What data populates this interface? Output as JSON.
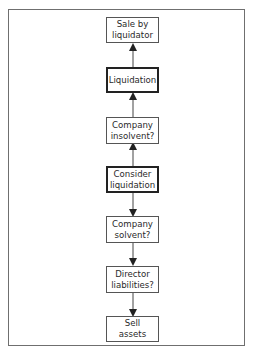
{
  "diagram": {
    "type": "flowchart",
    "orientation": "vertical",
    "colors": {
      "frame": "#6f6f6f",
      "node_border": "#555555",
      "node_border_emphasis": "#222222",
      "text": "#2a2a2a",
      "arrow": "#222222"
    },
    "nodes": [
      {
        "id": "sale_by_liquidator",
        "label": "Sale by\nliquidator",
        "emphasis": false
      },
      {
        "id": "liquidation",
        "label": "Liquidation",
        "emphasis": true
      },
      {
        "id": "company_insolvent",
        "label": "Company\ninsolvent?",
        "emphasis": false
      },
      {
        "id": "consider_liquidation",
        "label": "Consider\nliquidation",
        "emphasis": true
      },
      {
        "id": "company_solvent",
        "label": "Company\nsolvent?",
        "emphasis": false
      },
      {
        "id": "director_liabilities",
        "label": "Director\nliabilities?",
        "emphasis": false
      },
      {
        "id": "sell_assets",
        "label": "Sell\nassets",
        "emphasis": false
      }
    ],
    "edges": [
      {
        "from": "liquidation",
        "to": "sale_by_liquidator"
      },
      {
        "from": "company_insolvent",
        "to": "liquidation"
      },
      {
        "from": "consider_liquidation",
        "to": "company_insolvent"
      },
      {
        "from": "consider_liquidation",
        "to": "company_solvent"
      },
      {
        "from": "company_solvent",
        "to": "director_liabilities"
      },
      {
        "from": "director_liabilities",
        "to": "sell_assets"
      }
    ]
  }
}
